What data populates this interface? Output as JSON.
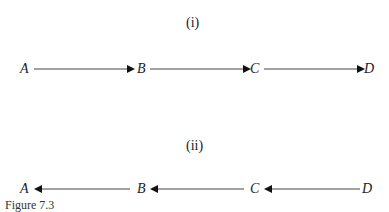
{
  "figure": {
    "caption": "Figure 7.3",
    "panels": [
      {
        "label": "(i)",
        "direction": "left-to-right",
        "nodes": [
          "A",
          "B",
          "C",
          "D"
        ],
        "edges": [
          [
            "A",
            "B"
          ],
          [
            "B",
            "C"
          ],
          [
            "C",
            "D"
          ]
        ]
      },
      {
        "label": "(ii)",
        "direction": "right-to-left",
        "nodes": [
          "A",
          "B",
          "C",
          "D"
        ],
        "edges": [
          [
            "B",
            "A"
          ],
          [
            "C",
            "B"
          ],
          [
            "D",
            "C"
          ]
        ]
      }
    ]
  },
  "colors": {
    "line": "#444444",
    "arrowhead": "#111111",
    "text": "#222222"
  }
}
